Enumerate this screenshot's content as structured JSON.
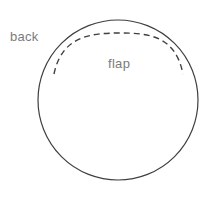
{
  "figure": {
    "background_color": "#ffffff",
    "stroke_color": "#3f3f42",
    "label_color": "#7b7b7b"
  },
  "labels": {
    "back": "back",
    "flap": "flap"
  },
  "shapes": {
    "outer_circle": {
      "name": "back-circle",
      "cx": 118,
      "cy": 100,
      "r": 80,
      "stroke": "#3f3f42",
      "stroke_width": 1.2,
      "fill": "none",
      "style": "solid"
    },
    "flap_arc": {
      "name": "flap-arc",
      "style": "dashed",
      "stroke": "#3f3f42",
      "stroke_width": 1.4,
      "dash_pattern": "6 4",
      "start_x": 54,
      "start_y": 74,
      "end_x": 183,
      "end_y": 74,
      "apex_x": 120,
      "apex_y": 33
    }
  }
}
